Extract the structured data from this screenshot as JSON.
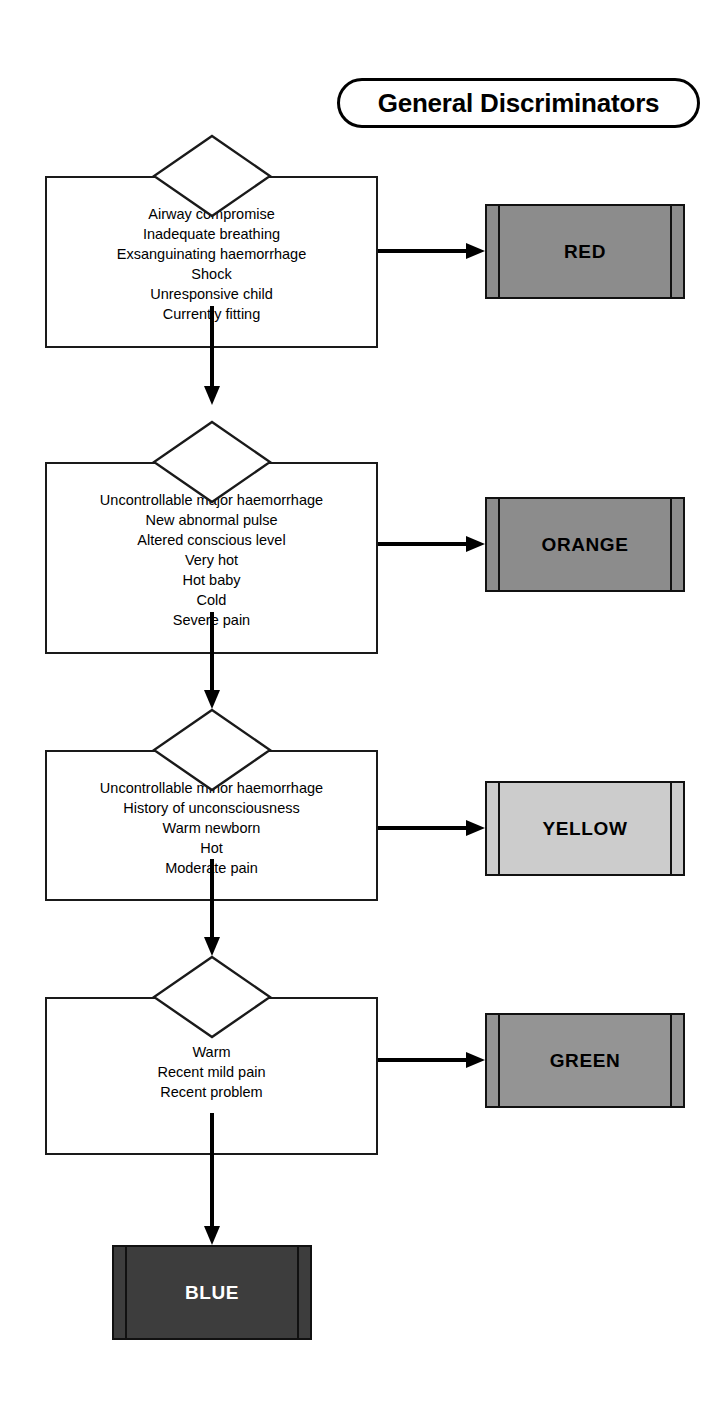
{
  "title": {
    "label": "General Discriminators"
  },
  "flow": {
    "steps": [
      {
        "id": "red-step",
        "criteria": [
          "Airway compromise",
          "Inadequate breathing",
          "Exsanguinating haemorrhage",
          "Shock",
          "Unresponsive child",
          "Currently fitting"
        ],
        "priority": {
          "name": "red",
          "label": "RED",
          "fill": "#8c8c8c",
          "text_color": "#000000"
        }
      },
      {
        "id": "orange-step",
        "criteria": [
          "Uncontrollable major haemorrhage",
          "New abnormal pulse",
          "Altered conscious level",
          "Very hot",
          "Hot baby",
          "Cold",
          "Severe pain"
        ],
        "priority": {
          "name": "orange",
          "label": "ORANGE",
          "fill": "#8c8c8c",
          "text_color": "#000000"
        }
      },
      {
        "id": "yellow-step",
        "criteria": [
          "Uncontrollable minor haemorrhage",
          "History of unconsciousness",
          "Warm newborn",
          "Hot",
          "Moderate pain"
        ],
        "priority": {
          "name": "yellow",
          "label": "YELLOW",
          "fill": "#cccccc",
          "text_color": "#000000"
        }
      },
      {
        "id": "green-step",
        "criteria": [
          "Warm",
          "Recent mild pain",
          "Recent problem"
        ],
        "priority": {
          "name": "green",
          "label": "GREEN",
          "fill": "#949494",
          "text_color": "#000000"
        }
      }
    ],
    "terminal": {
      "name": "blue",
      "label": "BLUE",
      "fill": "#3d3d3d",
      "text_color": "#ffffff"
    }
  }
}
